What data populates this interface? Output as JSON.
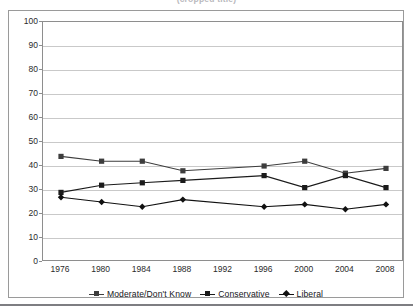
{
  "title_strip": {
    "text": "(cropped title)"
  },
  "legend": {
    "position": "bottom-center",
    "items": [
      {
        "label": "Moderate/Don't Know",
        "marker": "square",
        "color": "#3d3d3d"
      },
      {
        "label": "Conservative",
        "marker": "square",
        "color": "#1b1b1b"
      },
      {
        "label": "Liberal",
        "marker": "diamond",
        "color": "#111111"
      }
    ]
  },
  "chart_data": {
    "type": "line",
    "title": "",
    "xlabel": "",
    "ylabel": "",
    "categories": [
      "1976",
      "1980",
      "1984",
      "1988",
      "1992",
      "1996",
      "2000",
      "2004",
      "2008"
    ],
    "x": [
      1976,
      1980,
      1984,
      1988,
      1992,
      1996,
      2000,
      2004,
      2008
    ],
    "ylim": [
      0,
      100
    ],
    "yticks": [
      0,
      10,
      20,
      30,
      40,
      50,
      60,
      70,
      80,
      90,
      100
    ],
    "grid": true,
    "series": [
      {
        "name": "Moderate/Don't Know",
        "marker": "square",
        "color": "#3d3d3d",
        "values": [
          44,
          42,
          42,
          38,
          null,
          40,
          42,
          37,
          39
        ]
      },
      {
        "name": "Conservative",
        "marker": "square",
        "color": "#1b1b1b",
        "values": [
          29,
          32,
          33,
          34,
          null,
          36,
          31,
          36,
          31
        ]
      },
      {
        "name": "Liberal",
        "marker": "diamond",
        "color": "#111111",
        "values": [
          27,
          25,
          23,
          26,
          null,
          23,
          24,
          22,
          24
        ]
      }
    ]
  }
}
